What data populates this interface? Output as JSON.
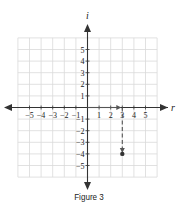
{
  "figure": {
    "caption": "Figure 3",
    "axes": {
      "horizontal_label": "r",
      "vertical_label": "i",
      "x_ticks": [
        -5,
        -4,
        -3,
        -2,
        -1,
        1,
        2,
        3,
        4,
        5
      ],
      "y_ticks": [
        5,
        4,
        3,
        2,
        1,
        -1,
        -2,
        -3,
        -4,
        -5
      ],
      "range": [
        -6,
        6
      ]
    },
    "point": {
      "real": 3,
      "imag": -4,
      "label": "3 - 4i"
    },
    "path": [
      {
        "from": [
          0,
          0
        ],
        "to": [
          3,
          0
        ],
        "style": "solid-arrow"
      },
      {
        "from": [
          3,
          0
        ],
        "to": [
          3,
          -4
        ],
        "style": "dashed-arrow"
      }
    ],
    "colors": {
      "grid": "#d9d9d9",
      "axis": "#333333",
      "path": "#555555"
    }
  }
}
